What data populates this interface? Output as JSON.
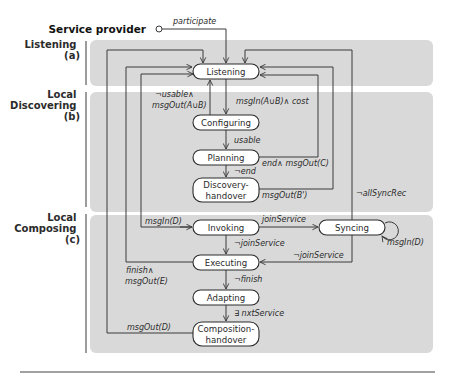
{
  "diagram": {
    "title": "Service provider",
    "start_label": "participate",
    "colors": {
      "lane_fill": "#d9d9d9",
      "state_fill": "#ffffff",
      "line": "#3a3a3a"
    },
    "lanes": [
      {
        "id": "listening",
        "label_lines": [
          "Listening",
          "(a)"
        ]
      },
      {
        "id": "discovering",
        "label_lines": [
          "Local",
          "Discovering",
          "(b)"
        ]
      },
      {
        "id": "composing",
        "label_lines": [
          "Local",
          "Composing",
          "(c)"
        ]
      }
    ],
    "states": {
      "listening": {
        "label_lines": [
          "Listening"
        ]
      },
      "configuring": {
        "label_lines": [
          "Configuring"
        ]
      },
      "planning": {
        "label_lines": [
          "Planning"
        ]
      },
      "discovery_handover": {
        "label_lines": [
          "Discovery-",
          "handover"
        ]
      },
      "invoking": {
        "label_lines": [
          "Invoking"
        ]
      },
      "syncing": {
        "label_lines": [
          "Syncing"
        ]
      },
      "executing": {
        "label_lines": [
          "Executing"
        ]
      },
      "adapting": {
        "label_lines": [
          "Adapting"
        ]
      },
      "composition_handover": {
        "label_lines": [
          "Composition-",
          "handover"
        ]
      }
    },
    "transitions": [
      {
        "from": "start",
        "to": "listening",
        "guard": "participate"
      },
      {
        "from": "configuring",
        "to": "listening",
        "guard_lines": [
          "¬usable∧",
          "msgOut(A∪B)"
        ]
      },
      {
        "from": "listening",
        "to": "configuring",
        "guard": "msgIn(A∪B)∧ cost"
      },
      {
        "from": "configuring",
        "to": "planning",
        "guard": "usable"
      },
      {
        "from": "planning",
        "to": "listening",
        "guard": "end∧ msgOut(C)"
      },
      {
        "from": "planning",
        "to": "discovery_handover",
        "guard": "¬end"
      },
      {
        "from": "discovery_handover",
        "to": "listening",
        "guard": "msgOut(B')"
      },
      {
        "from": "syncing",
        "to": "listening",
        "guard": "¬allSyncRec"
      },
      {
        "from": "listening",
        "to": "invoking",
        "guard": "msgIn(D)"
      },
      {
        "from": "invoking",
        "to": "syncing",
        "guard": "joinService"
      },
      {
        "from": "syncing",
        "to": "syncing",
        "guard": "msgIn(D)"
      },
      {
        "from": "invoking",
        "to": "executing",
        "guard": "¬joinService"
      },
      {
        "from": "syncing",
        "to": "executing",
        "guard": "¬joinService"
      },
      {
        "from": "executing",
        "to": "listening",
        "guard_lines": [
          "finish∧",
          "msgOut(E)"
        ]
      },
      {
        "from": "executing",
        "to": "adapting",
        "guard": "¬finish"
      },
      {
        "from": "adapting",
        "to": "composition_handover",
        "guard": "∃ nxtService"
      },
      {
        "from": "composition_handover",
        "to": "listening",
        "guard": "msgOut(D)"
      }
    ]
  }
}
